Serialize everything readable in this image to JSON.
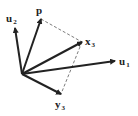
{
  "diagram": {
    "origin": [
      22,
      74
    ],
    "vectors": [
      {
        "name": "u2",
        "label": "u",
        "subscript": "2",
        "tip": [
          15,
          28
        ],
        "label_pos": [
          6,
          22
        ]
      },
      {
        "name": "p",
        "label": "p",
        "subscript": "",
        "tip": [
          41,
          19
        ],
        "label_pos": [
          36,
          14
        ]
      },
      {
        "name": "x3",
        "label": "x",
        "subscript": "3",
        "tip": [
          82,
          42
        ],
        "label_pos": [
          85,
          45
        ]
      },
      {
        "name": "u1",
        "label": "u",
        "subscript": "1",
        "tip": [
          115,
          61
        ],
        "label_pos": [
          119,
          65
        ]
      },
      {
        "name": "y3",
        "label": "y",
        "subscript": "3",
        "tip": [
          61,
          94
        ],
        "label_pos": [
          55,
          108
        ]
      }
    ],
    "dashed_lines": [
      {
        "from": "p",
        "to": "x3"
      },
      {
        "from": "x3",
        "to": "y3"
      }
    ],
    "color": "#222222"
  }
}
